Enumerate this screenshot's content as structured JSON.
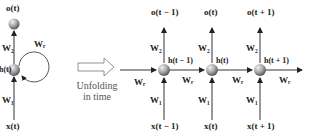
{
  "folded": {
    "output_label": "o(t)",
    "hidden_label": "h(t)",
    "input_label": "x(t)",
    "w_out": "W₂",
    "w_in": "W₁",
    "w_rec": "Wᵣ"
  },
  "transition": {
    "caption_line1": "Unfolding",
    "caption_line2": "in time"
  },
  "unfolded": {
    "steps": [
      {
        "output": "o(t − 1)",
        "hidden": "h(t − 1)",
        "input": "x(t − 1)",
        "w_out": "W₂",
        "w_in": "W₁",
        "w_rec": "Wᵣ"
      },
      {
        "output": "o(t)",
        "hidden": "h(t)",
        "input": "x(t)",
        "w_out": "W₂",
        "w_in": "W₁",
        "w_rec": "Wᵣ"
      },
      {
        "output": "o(t + 1)",
        "hidden": "h(t + 1)",
        "input": "x(t + 1)",
        "w_out": "W₂",
        "w_in": "W₁",
        "w_rec": "Wᵣ"
      }
    ],
    "w_rec_incoming": "Wᵣ"
  },
  "colors": {
    "line": "#333333",
    "sphere_light": "#e6e6e6",
    "sphere_dark": "#6e6e6e",
    "arrow_outline": "#777777"
  }
}
